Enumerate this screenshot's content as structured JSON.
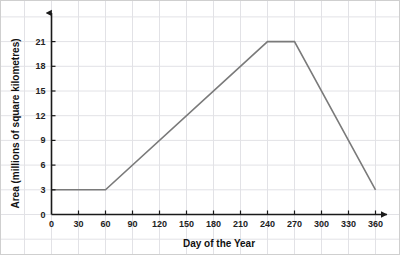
{
  "chart_data": {
    "type": "line",
    "title": "",
    "xlabel": "Day of the Year",
    "ylabel": "Area (millions of square kilometres)",
    "xlim": [
      0,
      375
    ],
    "ylim": [
      0,
      22
    ],
    "xticks": [
      0,
      30,
      60,
      90,
      120,
      150,
      180,
      210,
      240,
      270,
      300,
      330,
      360
    ],
    "yticks": [
      0,
      3,
      6,
      9,
      12,
      15,
      18,
      21
    ],
    "grid": true,
    "legend": "none",
    "line_color": "#7a7a7a",
    "axis_color": "#1a1a1a",
    "grid_color": "#e2e2e6",
    "series": [
      {
        "name": "Area",
        "x": [
          0,
          60,
          240,
          270,
          360
        ],
        "y": [
          3,
          3,
          21,
          21,
          3
        ]
      }
    ]
  }
}
